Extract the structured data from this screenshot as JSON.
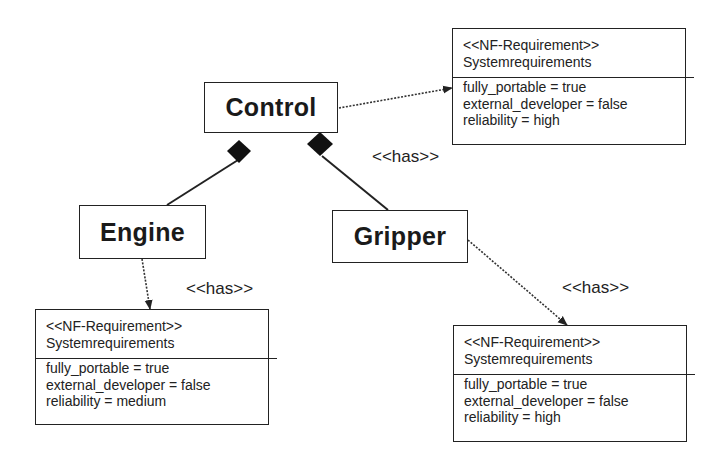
{
  "diagram": {
    "classes": {
      "control": "Control",
      "engine": "Engine",
      "gripper": "Gripper"
    },
    "relationship_labels": {
      "control_has": "<<has>>",
      "engine_has": "<<has>>",
      "gripper_has": "<<has>>"
    },
    "requirements": {
      "control": {
        "stereotype": "<<NF-Requirement>>",
        "name": "Systemrequirements",
        "attributes": [
          "fully_portable = true",
          "external_developer = false",
          "reliability = high"
        ]
      },
      "engine": {
        "stereotype": "<<NF-Requirement>>",
        "name": "Systemrequirements",
        "attributes": [
          "fully_portable = true",
          "external_developer = false",
          "reliability = medium"
        ]
      },
      "gripper": {
        "stereotype": "<<NF-Requirement>>",
        "name": "Systemrequirements",
        "attributes": [
          "fully_portable = true",
          "external_developer = false",
          "reliability = high"
        ]
      }
    },
    "colors": {
      "line": "#222222",
      "background": "#ffffff"
    }
  }
}
